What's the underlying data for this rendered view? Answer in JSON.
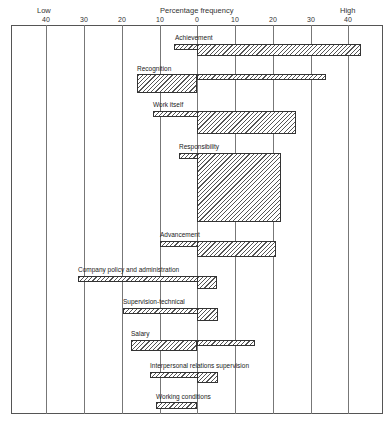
{
  "header": {
    "left_label": "Low",
    "center_label": "Percentage frequency",
    "right_label": "High"
  },
  "axis": {
    "ticks": [
      {
        "label": "40",
        "x": 46
      },
      {
        "label": "30",
        "x": 84
      },
      {
        "label": "20",
        "x": 122
      },
      {
        "label": "10",
        "x": 160
      },
      {
        "label": "0",
        "x": 197
      },
      {
        "label": "10",
        "x": 235
      },
      {
        "label": "20",
        "x": 273
      },
      {
        "label": "30",
        "x": 311
      },
      {
        "label": "40",
        "x": 348
      }
    ]
  },
  "chart_data": {
    "type": "bar",
    "title": "Percentage frequency",
    "xlabel": "Percentage frequency",
    "x_left_label": "Low",
    "x_right_label": "High",
    "xlim": [
      -40,
      40
    ],
    "x_ticks": [
      40,
      30,
      20,
      10,
      0,
      10,
      20,
      30,
      40
    ],
    "grid": true,
    "orientation": "horizontal-diverging",
    "categories": [
      "Achievement",
      "Recognition",
      "Work itself",
      "Responsibility",
      "Advancement",
      "Company policy and administration",
      "Supervision-technical",
      "Salary",
      "Interpersonal relations supervision",
      "Working conditions"
    ],
    "series": [
      {
        "name": "Low (left of 0)",
        "values": [
          6,
          16,
          11.5,
          5,
          10,
          31,
          20,
          17.5,
          12.5,
          11
        ]
      },
      {
        "name": "High (right of 0)",
        "values": [
          43,
          34,
          26,
          23,
          21,
          5.5,
          5.5,
          15.5,
          5.5,
          0
        ]
      }
    ]
  },
  "factors": [
    {
      "label": "Achievement",
      "label_x": 175,
      "label_y": 34,
      "segments": [
        {
          "left": 174,
          "width": 187,
          "top": 44,
          "height": 6
        },
        {
          "left": 197,
          "width": 164,
          "top": 44,
          "height": 12
        }
      ]
    },
    {
      "label": "Recognition",
      "label_x": 137,
      "label_y": 65,
      "segments": [
        {
          "left": 137,
          "width": 60,
          "top": 74,
          "height": 19
        },
        {
          "left": 197,
          "width": 129,
          "top": 74,
          "height": 6
        }
      ]
    },
    {
      "label": "Work itself",
      "label_x": 153,
      "label_y": 101,
      "segments": [
        {
          "left": 153,
          "width": 143,
          "top": 111,
          "height": 6
        },
        {
          "left": 197,
          "width": 99,
          "top": 111,
          "height": 23
        }
      ]
    },
    {
      "label": "Responsibility",
      "label_x": 179,
      "label_y": 143,
      "segments": [
        {
          "left": 179,
          "width": 102,
          "top": 153,
          "height": 6
        },
        {
          "left": 197,
          "width": 84,
          "top": 153,
          "height": 69
        }
      ]
    },
    {
      "label": "Advancement",
      "label_x": 160,
      "label_y": 231,
      "segments": [
        {
          "left": 160,
          "width": 116,
          "top": 241,
          "height": 6
        },
        {
          "left": 197,
          "width": 79,
          "top": 241,
          "height": 16
        }
      ]
    },
    {
      "label": "Company policy and administration",
      "label_x": 78,
      "label_y": 266,
      "segments": [
        {
          "left": 78,
          "width": 139,
          "top": 276,
          "height": 6
        },
        {
          "left": 197,
          "width": 20,
          "top": 276,
          "height": 13
        }
      ]
    },
    {
      "label": "Supervision-technical",
      "label_x": 123,
      "label_y": 298,
      "segments": [
        {
          "left": 123,
          "width": 95,
          "top": 308,
          "height": 6
        },
        {
          "left": 197,
          "width": 21,
          "top": 308,
          "height": 13
        }
      ]
    },
    {
      "label": "Salary",
      "label_x": 131,
      "label_y": 330,
      "segments": [
        {
          "left": 131,
          "width": 66,
          "top": 340,
          "height": 11
        },
        {
          "left": 197,
          "width": 58,
          "top": 340,
          "height": 6
        }
      ]
    },
    {
      "label": "Interpersonal relations supervision",
      "label_x": 150,
      "label_y": 362,
      "segments": [
        {
          "left": 150,
          "width": 68,
          "top": 372,
          "height": 6
        },
        {
          "left": 197,
          "width": 21,
          "top": 372,
          "height": 11
        }
      ]
    },
    {
      "label": "Working conditions",
      "label_x": 156,
      "label_y": 393,
      "segments": [
        {
          "left": 156,
          "width": 41,
          "top": 402,
          "height": 7
        }
      ]
    }
  ]
}
